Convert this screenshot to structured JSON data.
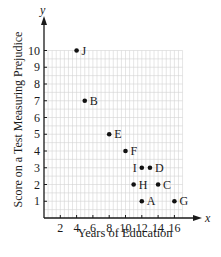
{
  "chart_data": {
    "type": "scatter",
    "title": "",
    "xlabel": "Years of Education",
    "ylabel": "Score on a Test Measuring Prejudice",
    "x_axis_symbol": "x",
    "y_axis_symbol": "y",
    "xlim": [
      0,
      17
    ],
    "ylim": [
      0,
      10
    ],
    "x_ticks": [
      2,
      4,
      6,
      8,
      10,
      12,
      14,
      16
    ],
    "y_ticks": [
      1,
      2,
      3,
      4,
      5,
      6,
      7,
      8,
      9,
      10
    ],
    "grid": true,
    "minor_grid_step": 0.5,
    "legend": "none",
    "points": [
      {
        "label": "A",
        "x": 12,
        "y": 1,
        "label_side": "right"
      },
      {
        "label": "B",
        "x": 5,
        "y": 7,
        "label_side": "right"
      },
      {
        "label": "C",
        "x": 14,
        "y": 2,
        "label_side": "right"
      },
      {
        "label": "D",
        "x": 13,
        "y": 3,
        "label_side": "right"
      },
      {
        "label": "E",
        "x": 8,
        "y": 5,
        "label_side": "right"
      },
      {
        "label": "F",
        "x": 10,
        "y": 4,
        "label_side": "right"
      },
      {
        "label": "G",
        "x": 16,
        "y": 1,
        "label_side": "right"
      },
      {
        "label": "H",
        "x": 11,
        "y": 2,
        "label_side": "right"
      },
      {
        "label": "I",
        "x": 12,
        "y": 3,
        "label_side": "left"
      },
      {
        "label": "J",
        "x": 4,
        "y": 10,
        "label_side": "right"
      }
    ]
  },
  "colors": {
    "axis": "#1a1a1a",
    "grid": "#d4d4d4",
    "point": "#111111"
  }
}
